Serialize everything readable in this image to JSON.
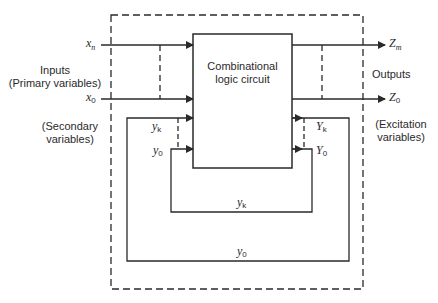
{
  "diagram": {
    "type": "sequential-circuit-block-diagram",
    "stroke_color": "#2a2a2a",
    "background": "#ffffff",
    "block": {
      "label_line1": "Combinational",
      "label_line2": "logic circuit"
    },
    "left_labels": {
      "inputs": "Inputs",
      "primary": "(Primary variables)",
      "secondary_line1": "(Secondary",
      "secondary_line2": "variables)"
    },
    "right_labels": {
      "outputs": "Outputs",
      "excitation_line1": "(Excitation",
      "excitation_line2": "variables)"
    },
    "inputs": [
      {
        "base": "x",
        "sub": "n"
      },
      {
        "base": "x",
        "sub": "0"
      }
    ],
    "outputs": [
      {
        "base": "Z",
        "sub": "m"
      },
      {
        "base": "Z",
        "sub": "0"
      }
    ],
    "secondary_inputs": [
      {
        "base": "y",
        "sub": "k"
      },
      {
        "base": "y",
        "sub": "0"
      }
    ],
    "excitation_outputs": [
      {
        "base": "Y",
        "sub": "k"
      },
      {
        "base": "Y",
        "sub": "0"
      }
    ],
    "feedback_loops": [
      {
        "base": "y",
        "sub": "k"
      },
      {
        "base": "y",
        "sub": "0"
      }
    ]
  }
}
